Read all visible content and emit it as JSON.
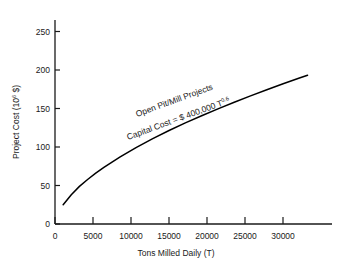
{
  "chart_data": {
    "type": "line",
    "title": "",
    "xlabel": "Tons Milled Daily (T)",
    "ylabel_main": "Project Cost (10",
    "ylabel_sup": "6",
    "ylabel_tail": " $)",
    "ylabel_full": "Project Cost (10^6 $)",
    "xlim": [
      0,
      34000
    ],
    "ylim": [
      0,
      265
    ],
    "grid": false,
    "legend": "none",
    "xticks": [
      0,
      5000,
      10000,
      15000,
      20000,
      25000,
      30000
    ],
    "xtick_labels": [
      "0",
      "5000",
      "10000",
      "15000",
      "20000",
      "25000",
      "30000"
    ],
    "yticks": [
      0,
      50,
      100,
      150,
      200,
      250
    ],
    "ytick_labels": [
      "0",
      "50",
      "100",
      "150",
      "200",
      "250"
    ],
    "series": [
      {
        "name": "Open Pit/Mill Projects",
        "formula": "Capital Cost = $ 400,000 T^0.6",
        "coefficient": 400000,
        "exponent": 0.6,
        "units": "10^6 $",
        "color": "#000000",
        "x": [
          1000,
          2000,
          3000,
          4000,
          5000,
          6000,
          7000,
          8000,
          9000,
          10000,
          12000,
          14000,
          16000,
          18000,
          20000,
          22000,
          24000,
          26000,
          28000,
          30000,
          31000
        ],
        "y": [
          25.1,
          38.1,
          48.9,
          57.8,
          66.0,
          73.5,
          80.5,
          87.1,
          93.4,
          99.5,
          110.8,
          121.4,
          131.3,
          140.7,
          149.6,
          158.2,
          166.5,
          174.4,
          182.1,
          189.6,
          193.3
        ]
      }
    ],
    "annotations": [
      {
        "name": "series-label",
        "text": "Open Pit/Mill Projects",
        "rotation": -20
      },
      {
        "name": "formula-label",
        "text_pre": "Capital Cost = $ 400,000 T",
        "text_sup": "0.6",
        "rotation": -20
      }
    ]
  }
}
